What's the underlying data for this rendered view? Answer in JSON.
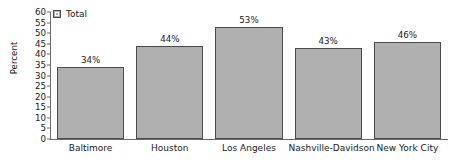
{
  "chart_data": {
    "type": "bar",
    "title": "",
    "xlabel": "",
    "ylabel": "Percent",
    "categories": [
      "Baltimore",
      "Houston",
      "Los Angeles",
      "Nashville-Davidson",
      "New York City"
    ],
    "values": [
      34,
      44,
      53,
      43,
      46
    ],
    "data_labels": [
      "34%",
      "44%",
      "53%",
      "43%",
      "46%"
    ],
    "series": [
      {
        "name": "Total",
        "values": [
          34,
          44,
          53,
          43,
          46
        ]
      }
    ],
    "ylim": [
      0,
      60
    ],
    "ytick_step": 5,
    "ytick_labels": [
      "60",
      "55",
      "50",
      "45",
      "40",
      "35",
      "30",
      "25",
      "20",
      "15",
      "10",
      "5",
      "0"
    ],
    "grid": false,
    "legend_position": "top-left",
    "legend_entries": [
      "Total"
    ],
    "colors": {
      "bar_fill": "#b0b0b0",
      "bar_border": "#4a4a4a",
      "axis": "#6b6b6b",
      "text": "#1a1a1a",
      "background": "#ffffff"
    }
  }
}
